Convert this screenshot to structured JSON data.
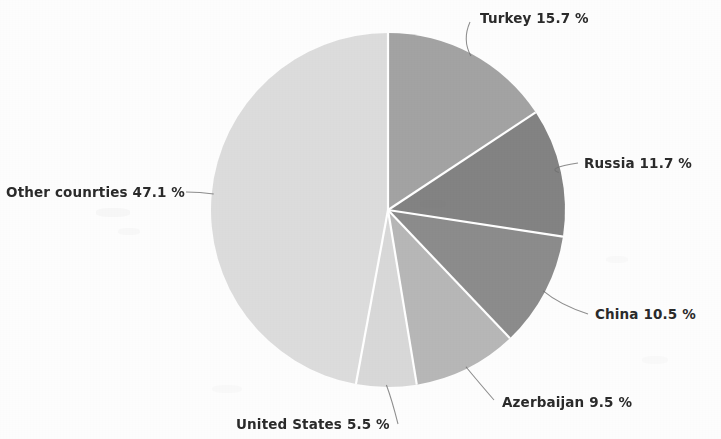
{
  "chart_data": {
    "type": "pie",
    "title": "",
    "subtitle": "",
    "xlabel": "",
    "ylabel": "",
    "legend_position": "none",
    "grid": false,
    "unit": "%",
    "categories": [
      "Turkey",
      "Russia",
      "China",
      "Azerbaijan",
      "United States",
      "Other counrties"
    ],
    "values": [
      15.7,
      11.7,
      10.5,
      9.5,
      5.5,
      47.1
    ],
    "labels": [
      "Turkey 15.7 %",
      "Russia 11.7 %",
      "China 10.5 %",
      "Azerbaijan 9.5 %",
      "United States 5.5 %",
      "Other counrties 47.1 %"
    ],
    "slice_colors": [
      "#a3a3a3",
      "#838383",
      "#8c8c8c",
      "#b7b7b7",
      "#d8d8d8",
      "#dcdcdc"
    ],
    "start_angle_deg": 0,
    "direction": "clockwise"
  },
  "chart": {
    "center_x": 388,
    "center_y": 210,
    "radius": 177,
    "slice_separator_color": "#ffffff",
    "leader_line_color": "#6e6e6e",
    "label_text_color": "#2b2b2b",
    "background_color": "#fdfdfd"
  },
  "slices": [
    {
      "name": "turkey",
      "label": "Turkey 15.7 %",
      "value": 15.7,
      "color": "#a3a3a3",
      "label_x": 480,
      "label_y": 12
    },
    {
      "name": "russia",
      "label": "Russia 11.7 %",
      "value": 11.7,
      "color": "#838383",
      "label_x": 584,
      "label_y": 157
    },
    {
      "name": "china",
      "label": "China 10.5 %",
      "value": 10.5,
      "color": "#8c8c8c",
      "label_x": 595,
      "label_y": 308
    },
    {
      "name": "azerbaijan",
      "label": "Azerbaijan 9.5 %",
      "value": 9.5,
      "color": "#b7b7b7",
      "label_x": 502,
      "label_y": 396
    },
    {
      "name": "united-states",
      "label": "United States 5.5 %",
      "value": 5.5,
      "color": "#d8d8d8",
      "label_x": 236,
      "label_y": 418
    },
    {
      "name": "other-countries",
      "label": "Other counrties 47.1 %",
      "value": 47.1,
      "color": "#dcdcdc",
      "label_x": 6,
      "label_y": 186
    }
  ]
}
